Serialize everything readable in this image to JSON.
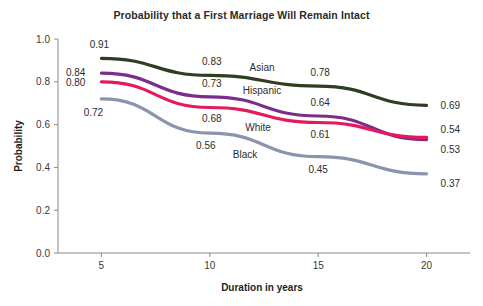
{
  "chart_data": {
    "type": "line",
    "title": "Probability that a First Marriage Will Remain Intact",
    "xlabel": "Duration in years",
    "ylabel": "Probability",
    "xlim": [
      3,
      22
    ],
    "ylim": [
      0.0,
      1.0
    ],
    "xticks": [
      "5",
      "10",
      "15",
      "20"
    ],
    "xtick_values": [
      5,
      10,
      15,
      20
    ],
    "yticks": [
      "0.0",
      "0.2",
      "0.4",
      "0.6",
      "0.8",
      "1.0"
    ],
    "ytick_values": [
      0.0,
      0.2,
      0.4,
      0.6,
      0.8,
      1.0
    ],
    "grid": false,
    "legend": "inline-series-labels",
    "x": [
      5,
      10,
      15,
      20
    ],
    "series": [
      {
        "name": "Asian",
        "color": "#2f3d21",
        "values": [
          0.91,
          0.83,
          0.78,
          0.69
        ],
        "labels": [
          "0.91",
          "0.83",
          "0.78",
          "0.69"
        ]
      },
      {
        "name": "Hispanic",
        "color": "#7b2d8e",
        "values": [
          0.84,
          0.73,
          0.64,
          0.53
        ],
        "labels": [
          "0.84",
          "0.73",
          "0.64",
          "0.53"
        ]
      },
      {
        "name": "White",
        "color": "#e51a5e",
        "values": [
          0.8,
          0.68,
          0.61,
          0.54
        ],
        "labels": [
          "0.80",
          "0.68",
          "0.61",
          "0.54"
        ]
      },
      {
        "name": "Black",
        "color": "#8b94ab",
        "values": [
          0.72,
          0.56,
          0.45,
          0.37
        ],
        "labels": [
          "0.72",
          "0.56",
          "0.45",
          "0.37"
        ]
      }
    ]
  }
}
